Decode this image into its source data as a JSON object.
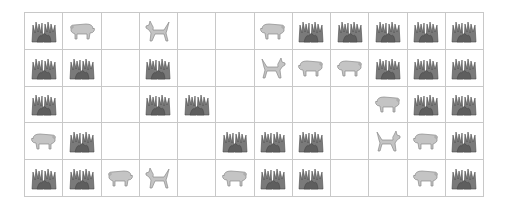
{
  "grid": {
    "rows": 5,
    "cols": 12,
    "colors": {
      "grass": "#6b6b6b",
      "animal_fill": "#c4c4c4",
      "animal_stroke": "#8a8a8a",
      "line": "#c8c8c8"
    },
    "cells": [
      [
        "grass",
        "pig-left",
        "empty",
        "dog-left",
        "empty",
        "empty",
        "pig-right",
        "grass",
        "grass",
        "grass",
        "grass",
        "grass"
      ],
      [
        "grass",
        "grass",
        "empty",
        "grass",
        "empty",
        "empty",
        "dog-right",
        "pig-right",
        "pig-right",
        "grass",
        "grass",
        "grass"
      ],
      [
        "grass",
        "empty",
        "empty",
        "grass",
        "grass",
        "empty",
        "empty",
        "empty",
        "empty",
        "pig-right",
        "grass",
        "grass"
      ],
      [
        "pig-right",
        "grass",
        "empty",
        "empty",
        "empty",
        "grass",
        "grass",
        "grass",
        "empty",
        "dog-right",
        "pig-right",
        "grass"
      ],
      [
        "grass",
        "grass",
        "pig-left",
        "dog-left",
        "empty",
        "pig-right",
        "grass",
        "grass",
        "empty",
        "empty",
        "pig-right",
        "grass"
      ]
    ]
  }
}
